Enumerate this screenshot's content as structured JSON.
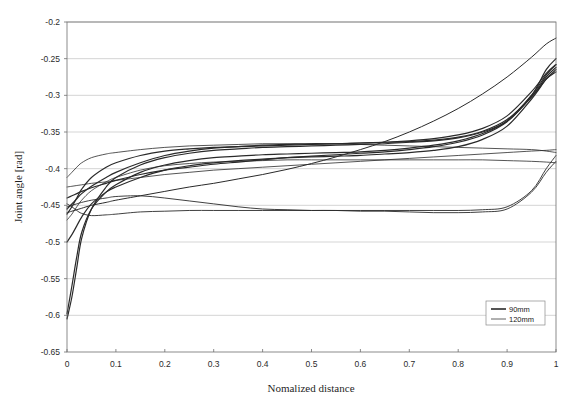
{
  "chart_data": {
    "type": "line",
    "title": "",
    "xlabel": "Nomalized distance",
    "ylabel": "Joint angle [rad]",
    "xlim": [
      0,
      1
    ],
    "ylim": [
      -0.65,
      -0.2
    ],
    "grid": "horizontal",
    "legend_position": "bottom-right",
    "xticks": [
      "0",
      "0.1",
      "0.2",
      "0.3",
      "0.4",
      "0.5",
      "0.6",
      "0.7",
      "0.8",
      "0.9",
      "1"
    ],
    "xtick_values": [
      0,
      0.1,
      0.2,
      0.3,
      0.4,
      0.5,
      0.6,
      0.7,
      0.8,
      0.9,
      1
    ],
    "yticks": [
      "-0.2",
      "-0.25",
      "-0.3",
      "-0.35",
      "-0.4",
      "-0.45",
      "-0.5",
      "-0.55",
      "-0.6",
      "-0.65"
    ],
    "ytick_values": [
      -0.2,
      -0.25,
      -0.3,
      -0.35,
      -0.4,
      -0.45,
      -0.5,
      -0.55,
      -0.6,
      -0.65
    ],
    "legend": [
      {
        "label": "90mm",
        "color": "#1c1c1c",
        "width": 1.5
      },
      {
        "label": "120mm",
        "color": "#3a3a3a",
        "width": 0.8
      }
    ],
    "x": [
      0,
      0.01,
      0.02,
      0.03,
      0.05,
      0.08,
      0.1,
      0.15,
      0.2,
      0.25,
      0.3,
      0.35,
      0.4,
      0.45,
      0.5,
      0.55,
      0.6,
      0.65,
      0.7,
      0.75,
      0.8,
      0.85,
      0.9,
      0.95,
      0.98,
      1
    ],
    "series": [
      {
        "name": "90mm-1",
        "group": "90mm",
        "color": "#1c1c1c",
        "width": 1.2,
        "values": [
          -0.605,
          -0.575,
          -0.535,
          -0.495,
          -0.455,
          -0.425,
          -0.412,
          -0.395,
          -0.385,
          -0.379,
          -0.375,
          -0.373,
          -0.371,
          -0.37,
          -0.369,
          -0.368,
          -0.367,
          -0.366,
          -0.364,
          -0.362,
          -0.358,
          -0.35,
          -0.335,
          -0.3,
          -0.265,
          -0.25
        ]
      },
      {
        "name": "90mm-2",
        "group": "90mm",
        "color": "#222222",
        "width": 1.2,
        "values": [
          -0.598,
          -0.56,
          -0.52,
          -0.487,
          -0.455,
          -0.432,
          -0.422,
          -0.405,
          -0.395,
          -0.389,
          -0.385,
          -0.383,
          -0.381,
          -0.38,
          -0.379,
          -0.378,
          -0.377,
          -0.375,
          -0.372,
          -0.368,
          -0.362,
          -0.352,
          -0.335,
          -0.3,
          -0.272,
          -0.258
        ]
      },
      {
        "name": "90mm-3",
        "group": "90mm",
        "color": "#262626",
        "width": 1.2,
        "values": [
          -0.5,
          -0.49,
          -0.478,
          -0.466,
          -0.448,
          -0.432,
          -0.425,
          -0.412,
          -0.402,
          -0.396,
          -0.392,
          -0.389,
          -0.387,
          -0.385,
          -0.384,
          -0.383,
          -0.382,
          -0.38,
          -0.378,
          -0.375,
          -0.37,
          -0.36,
          -0.342,
          -0.305,
          -0.278,
          -0.265
        ]
      },
      {
        "name": "90mm-4",
        "group": "90mm",
        "color": "#2a2a2a",
        "width": 1.2,
        "values": [
          -0.462,
          -0.452,
          -0.44,
          -0.428,
          -0.412,
          -0.398,
          -0.392,
          -0.382,
          -0.376,
          -0.373,
          -0.371,
          -0.37,
          -0.369,
          -0.368,
          -0.367,
          -0.366,
          -0.365,
          -0.364,
          -0.362,
          -0.359,
          -0.354,
          -0.345,
          -0.328,
          -0.295,
          -0.27,
          -0.258
        ]
      },
      {
        "name": "90mm-5",
        "group": "90mm",
        "color": "#1f1f1f",
        "width": 1.2,
        "values": [
          -0.455,
          -0.448,
          -0.441,
          -0.434,
          -0.424,
          -0.412,
          -0.405,
          -0.392,
          -0.382,
          -0.376,
          -0.372,
          -0.37,
          -0.368,
          -0.367,
          -0.366,
          -0.366,
          -0.365,
          -0.364,
          -0.363,
          -0.361,
          -0.357,
          -0.349,
          -0.333,
          -0.302,
          -0.278,
          -0.268
        ]
      },
      {
        "name": "90mm-6",
        "group": "90mm",
        "color": "#303030",
        "width": 1.2,
        "values": [
          -0.44,
          -0.437,
          -0.434,
          -0.431,
          -0.426,
          -0.42,
          -0.416,
          -0.408,
          -0.402,
          -0.398,
          -0.394,
          -0.391,
          -0.388,
          -0.385,
          -0.383,
          -0.381,
          -0.379,
          -0.377,
          -0.374,
          -0.37,
          -0.364,
          -0.354,
          -0.336,
          -0.302,
          -0.275,
          -0.262
        ]
      },
      {
        "name": "120mm-1",
        "group": "120mm",
        "color": "#3c3c3c",
        "width": 0.8,
        "values": [
          -0.425,
          -0.424,
          -0.423,
          -0.422,
          -0.42,
          -0.418,
          -0.416,
          -0.412,
          -0.408,
          -0.405,
          -0.402,
          -0.4,
          -0.398,
          -0.396,
          -0.394,
          -0.392,
          -0.39,
          -0.388,
          -0.386,
          -0.384,
          -0.382,
          -0.38,
          -0.378,
          -0.376,
          -0.375,
          -0.374
        ]
      },
      {
        "name": "120mm-2",
        "group": "120mm",
        "color": "#404040",
        "width": 0.8,
        "values": [
          -0.412,
          -0.405,
          -0.398,
          -0.392,
          -0.385,
          -0.38,
          -0.378,
          -0.374,
          -0.371,
          -0.369,
          -0.368,
          -0.367,
          -0.366,
          -0.366,
          -0.366,
          -0.366,
          -0.367,
          -0.368,
          -0.369,
          -0.37,
          -0.371,
          -0.372,
          -0.373,
          -0.374,
          -0.376,
          -0.378
        ]
      },
      {
        "name": "120mm-3",
        "group": "120mm",
        "color": "#383838",
        "width": 0.8,
        "values": [
          -0.47,
          -0.462,
          -0.452,
          -0.443,
          -0.43,
          -0.418,
          -0.412,
          -0.402,
          -0.396,
          -0.393,
          -0.391,
          -0.39,
          -0.389,
          -0.388,
          -0.388,
          -0.388,
          -0.388,
          -0.388,
          -0.388,
          -0.388,
          -0.388,
          -0.388,
          -0.389,
          -0.39,
          -0.391,
          -0.392
        ]
      },
      {
        "name": "120mm-4",
        "group": "120mm",
        "color": "#343434",
        "width": 0.9,
        "values": [
          -0.452,
          -0.45,
          -0.448,
          -0.446,
          -0.443,
          -0.44,
          -0.438,
          -0.437,
          -0.44,
          -0.444,
          -0.448,
          -0.452,
          -0.455,
          -0.456,
          -0.457,
          -0.457,
          -0.457,
          -0.457,
          -0.457,
          -0.457,
          -0.457,
          -0.456,
          -0.452,
          -0.43,
          -0.4,
          -0.382
        ]
      },
      {
        "name": "120mm-5",
        "group": "120mm",
        "color": "#2e2e2e",
        "width": 0.9,
        "values": [
          -0.448,
          -0.452,
          -0.457,
          -0.461,
          -0.464,
          -0.463,
          -0.462,
          -0.459,
          -0.458,
          -0.457,
          -0.457,
          -0.457,
          -0.457,
          -0.457,
          -0.457,
          -0.457,
          -0.458,
          -0.458,
          -0.459,
          -0.46,
          -0.46,
          -0.459,
          -0.455,
          -0.432,
          -0.405,
          -0.39
        ]
      },
      {
        "name": "120mm-6",
        "group": "120mm",
        "color": "#2c2c2c",
        "width": 1.0,
        "values": [
          -0.46,
          -0.458,
          -0.456,
          -0.454,
          -0.45,
          -0.446,
          -0.443,
          -0.437,
          -0.431,
          -0.425,
          -0.42,
          -0.414,
          -0.408,
          -0.401,
          -0.393,
          -0.384,
          -0.374,
          -0.363,
          -0.35,
          -0.335,
          -0.318,
          -0.298,
          -0.275,
          -0.248,
          -0.23,
          -0.222
        ]
      }
    ]
  },
  "figure": {
    "background": "#ffffff",
    "axis_color": "#6f6f6f",
    "grid_color": "#b9b9b9"
  }
}
